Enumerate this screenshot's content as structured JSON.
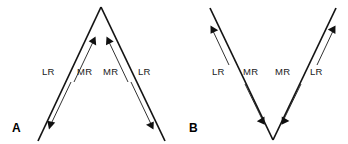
{
  "figure": {
    "background_color": "#ffffff",
    "line_color": "#141414",
    "text_color": "#1a1a1a",
    "panels": [
      {
        "id": "A",
        "label": "A",
        "shape": "inverted-v",
        "labels": [
          {
            "name": "lr-left",
            "text": "LR"
          },
          {
            "name": "mr-left",
            "text": "MR"
          },
          {
            "name": "mr-right",
            "text": "MR"
          },
          {
            "name": "lr-right",
            "text": "LR"
          }
        ],
        "arrows": [
          {
            "name": "lr-left-arrow",
            "muscle": "LR",
            "direction": "down-left"
          },
          {
            "name": "mr-left-arrow",
            "muscle": "MR",
            "direction": "up-right"
          },
          {
            "name": "mr-right-arrow",
            "muscle": "MR",
            "direction": "up-left"
          },
          {
            "name": "lr-right-arrow",
            "muscle": "LR",
            "direction": "down-right"
          }
        ]
      },
      {
        "id": "B",
        "label": "B",
        "shape": "v",
        "labels": [
          {
            "name": "lr-left",
            "text": "LR"
          },
          {
            "name": "mr-left",
            "text": "MR"
          },
          {
            "name": "mr-right",
            "text": "MR"
          },
          {
            "name": "lr-right",
            "text": "LR"
          }
        ],
        "arrows": [
          {
            "name": "lr-left-arrow",
            "muscle": "LR",
            "direction": "up-left"
          },
          {
            "name": "mr-left-arrow",
            "muscle": "MR",
            "direction": "down-right"
          },
          {
            "name": "mr-right-arrow",
            "muscle": "MR",
            "direction": "down-left"
          },
          {
            "name": "lr-right-arrow",
            "muscle": "LR",
            "direction": "up-right"
          }
        ]
      }
    ]
  }
}
